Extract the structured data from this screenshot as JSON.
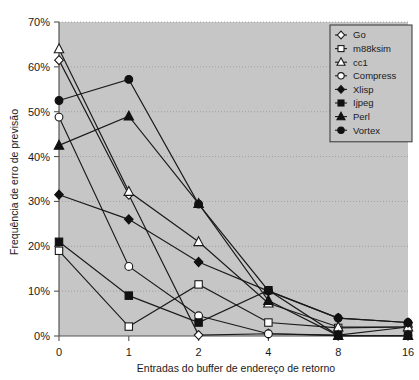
{
  "chart_data": {
    "type": "line",
    "title": "",
    "xlabel": "Entradas do buffer de endereço de retorno",
    "ylabel": "Frequência de erro de previsão",
    "categories": [
      "0",
      "1",
      "2",
      "4",
      "8",
      "16"
    ],
    "ytick_labels": [
      "0%",
      "10%",
      "20%",
      "30%",
      "40%",
      "50%",
      "60%",
      "70%"
    ],
    "ytick_values": [
      0,
      10,
      20,
      30,
      40,
      50,
      60,
      70
    ],
    "ylim": [
      0,
      70
    ],
    "yunit": "%",
    "grid": true,
    "legend_position": "top-right",
    "plot_background": "#c6c6c6",
    "series": [
      {
        "name": "Go",
        "marker": "open-diamond",
        "values": [
          61.5,
          31.5,
          0.2,
          0.5,
          0.2,
          2.0
        ]
      },
      {
        "name": "m88ksim",
        "marker": "open-square",
        "values": [
          19.0,
          2.1,
          11.5,
          3.0,
          1.8,
          2.0
        ]
      },
      {
        "name": "cc1",
        "marker": "open-triangle",
        "values": [
          64.0,
          32.2,
          21.0,
          7.3,
          2.0,
          2.0
        ]
      },
      {
        "name": "Compress",
        "marker": "open-circle",
        "values": [
          48.8,
          15.5,
          4.5,
          0.5,
          0.1,
          0.1
        ]
      },
      {
        "name": "Xlisp",
        "marker": "filled-diamond",
        "values": [
          31.5,
          26.0,
          16.5,
          10.0,
          4.0,
          3.0
        ]
      },
      {
        "name": "Ijpeg",
        "marker": "filled-square",
        "values": [
          21.0,
          9.0,
          3.0,
          10.2,
          0.1,
          0.1
        ]
      },
      {
        "name": "Perl",
        "marker": "filled-triangle",
        "values": [
          42.5,
          49.0,
          29.5,
          7.9,
          0.1,
          0.1
        ]
      },
      {
        "name": "Vortex",
        "marker": "filled-circle",
        "values": [
          52.5,
          57.2,
          29.4,
          10.1,
          4.0,
          3.0
        ]
      }
    ]
  },
  "legend": {
    "items": [
      {
        "label": "Go"
      },
      {
        "label": "m88ksim"
      },
      {
        "label": "cc1"
      },
      {
        "label": "Compress"
      },
      {
        "label": "Xlisp"
      },
      {
        "label": "Ijpeg"
      },
      {
        "label": "Perl"
      },
      {
        "label": "Vortex"
      }
    ]
  }
}
